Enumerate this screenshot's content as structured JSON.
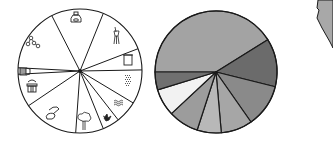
{
  "chart_data": [
    {
      "type": "pie",
      "title": "",
      "style": "line-drawing with pictograms",
      "center": [
        80,
        71
      ],
      "radius": 62,
      "boundaries_deg": [
        243,
        292,
        339,
        359,
        31,
        52,
        68,
        94,
        146,
        177,
        183
      ],
      "slices": [
        {
          "icon": "bottle-icon",
          "start": 243,
          "end": 292
        },
        {
          "icon": "tassel-icon",
          "start": 292,
          "end": 339
        },
        {
          "icon": "frame-icon",
          "start": 339,
          "end": 359
        },
        {
          "icon": "dotted-block-icon",
          "start": 359,
          "end": 391
        },
        {
          "icon": "wave-pattern-icon",
          "start": 31,
          "end": 52
        },
        {
          "icon": "splash-icon",
          "start": 52,
          "end": 68
        },
        {
          "icon": "tree-icon",
          "start": 68,
          "end": 94
        },
        {
          "icon": "spray-nozzle-icon",
          "start": 94,
          "end": 146
        },
        {
          "icon": "jar-icon",
          "start": 146,
          "end": 177
        },
        {
          "icon": "brush-icon",
          "start": 177,
          "end": 183
        },
        {
          "icon": "molecule-icon",
          "start": 183,
          "end": 243
        }
      ]
    },
    {
      "type": "pie",
      "title": "",
      "style": "grayscale filled",
      "center": [
        216,
        72
      ],
      "radius": 61,
      "slices": [
        {
          "start": 180,
          "end": 328,
          "color": "#a3a3a3"
        },
        {
          "start": 328,
          "end": 374,
          "color": "#6b6b6b"
        },
        {
          "start": 14,
          "end": 55,
          "color": "#8a8a8a"
        },
        {
          "start": 55,
          "end": 85,
          "color": "#a6a6a6"
        },
        {
          "start": 85,
          "end": 108,
          "color": "#b8b8b8"
        },
        {
          "start": 108,
          "end": 137,
          "color": "#9c9c9c"
        },
        {
          "start": 137,
          "end": 163,
          "color": "#f2f2f2"
        },
        {
          "start": 163,
          "end": 180,
          "color": "#707070"
        }
      ]
    }
  ],
  "colors": {
    "line": "#1a1a1a",
    "edge_shape_fill": "#a8a8a8"
  }
}
